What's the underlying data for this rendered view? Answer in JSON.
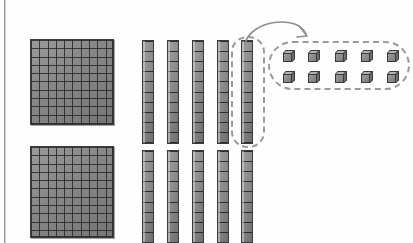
{
  "scene": {
    "title": "Base-ten blocks regrouping diagram",
    "background_color": "#fefefe",
    "block_fill_color": "#8a8a8a",
    "block_line_color": "#3b3b3b",
    "annotation_color": "#9b9b9b"
  },
  "legend": {
    "flat_name": "hundred flat",
    "rod_name": "ten rod",
    "unit_name": "one cube"
  },
  "rows": [
    {
      "id": "top-row",
      "flats": 1,
      "rods": 5,
      "units": 10,
      "circled_rod_index": 5,
      "units_grid": {
        "columns": 5,
        "rows": 2
      }
    },
    {
      "id": "bottom-row",
      "flats": 1,
      "rods": 5,
      "units": 0,
      "circled_rod_index": 0,
      "units_grid": {
        "columns": 0,
        "rows": 0
      }
    }
  ],
  "annotations": {
    "rod_circle_label": "regrouped ten rod",
    "units_group_label": "ten ones",
    "arrow_label": "regroup arrow",
    "arrow_direction": "left-to-right-curved"
  },
  "counts": {
    "flat_grid_columns": 10,
    "flat_grid_rows": 10,
    "rod_segments": 10,
    "total_units_in_group": 10
  }
}
